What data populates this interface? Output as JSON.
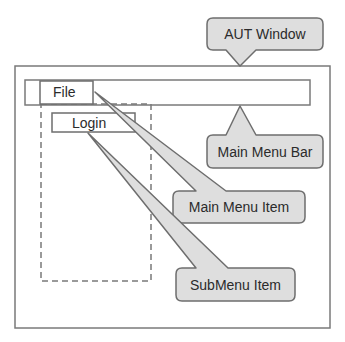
{
  "diagram": {
    "window": {
      "label": "AUT Window"
    },
    "menu_bar": {
      "label": "Main Menu Bar"
    },
    "main_menu_item": {
      "text": "File",
      "label": "Main Menu Item"
    },
    "submenu_item": {
      "text": "Login",
      "label": "SubMenu Item"
    }
  },
  "colors": {
    "callout_fill": "#dedede",
    "callout_stroke": "#6e6e6e",
    "line": "#7a7a7a",
    "text": "#2b2b2b"
  }
}
